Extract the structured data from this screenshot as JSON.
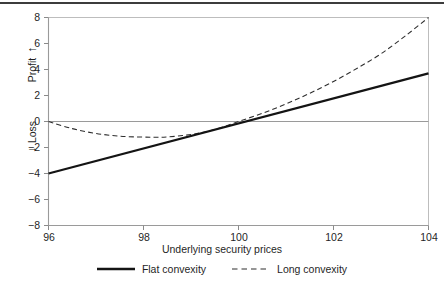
{
  "chart_data": {
    "type": "line",
    "title": "",
    "xlabel": "Underlying security prices",
    "ylabel_positive": "Profit",
    "ylabel_negative": "Loss",
    "ylabel_positive_arrow": "↑",
    "ylabel_negative_arrow": "↓",
    "xlim": [
      96,
      104
    ],
    "ylim": [
      -8,
      8
    ],
    "xticks": [
      96,
      98,
      100,
      102,
      104
    ],
    "yticks": [
      8,
      6,
      4,
      2,
      0,
      -2,
      -4,
      -6,
      -8
    ],
    "xtick_labels": [
      "96",
      "98",
      "100",
      "102",
      "104"
    ],
    "ytick_labels": [
      "8",
      "6",
      "4",
      "2",
      "0",
      "−2",
      "−4",
      "−6",
      "−8"
    ],
    "grid": false,
    "zero_line": true,
    "legend_position": "below",
    "series": [
      {
        "name": "Flat convexity",
        "style": "solid",
        "color": "#141414",
        "x": [
          96,
          97,
          98,
          99,
          100,
          101,
          102,
          103,
          104
        ],
        "values": [
          -4.0,
          -3.04,
          -2.08,
          -1.12,
          0.0,
          0.93,
          1.85,
          2.78,
          3.7
        ]
      },
      {
        "name": "Long convexity",
        "style": "dashed",
        "color": "#2e2e2e",
        "x": [
          96,
          96.5,
          97,
          97.5,
          98,
          98.3,
          98.5,
          99,
          99.5,
          100,
          100.5,
          101,
          101.5,
          102,
          102.5,
          103,
          103.5,
          104
        ],
        "values": [
          0.0,
          -0.55,
          -0.92,
          -1.13,
          -1.2,
          -1.21,
          -1.19,
          -1.0,
          -0.62,
          0.0,
          0.63,
          1.35,
          2.17,
          3.08,
          4.1,
          5.21,
          6.55,
          8.0
        ]
      }
    ],
    "annotations": []
  },
  "legend": {
    "items": [
      {
        "label": "Flat convexity",
        "style": "solid"
      },
      {
        "label": "Long convexity",
        "style": "dashed"
      }
    ]
  }
}
